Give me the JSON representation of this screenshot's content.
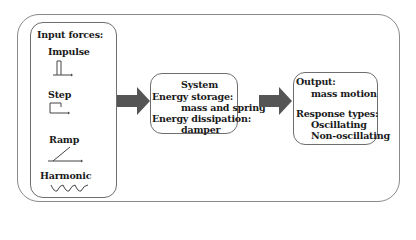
{
  "input": {
    "title": "Input forces:",
    "signals": [
      {
        "label": "Impulse",
        "icon": "impulse-icon"
      },
      {
        "label": "Step",
        "icon": "step-icon"
      },
      {
        "label": "Ramp",
        "icon": "ramp-icon"
      },
      {
        "label": "Harmonic",
        "icon": "harmonic-icon"
      }
    ]
  },
  "system": {
    "title": "System",
    "storage_label": "Energy storage:",
    "storage_value": "mass and spring",
    "dissipation_label": "Energy dissipation:",
    "dissipation_value": "damper"
  },
  "output": {
    "title": "Output:",
    "value": "mass motion",
    "response_label": "Response types:",
    "responses": [
      "Oscillating",
      "Non-oscillating"
    ]
  },
  "colors": {
    "arrow": "#555555",
    "box_border": "#6e6e6e",
    "frame_border": "#8a8a8a"
  }
}
